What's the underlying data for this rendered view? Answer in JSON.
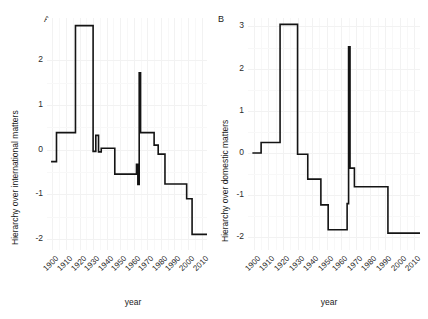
{
  "figure": {
    "width": 428,
    "height": 319,
    "background": "#ffffff",
    "gridline_color": "#f2f2f2",
    "line_color": "#141414"
  },
  "panels": {
    "a": {
      "tag": "A",
      "ylabel": "Hierarchy over international matters",
      "xlabel": "year"
    },
    "b": {
      "tag": "B",
      "ylabel": "Hierarchy over domestic matters",
      "xlabel": "year"
    }
  },
  "chart_data": [
    {
      "type": "line",
      "panel": "A",
      "title": "A",
      "xlabel": "year",
      "ylabel": "Hierarchy over international matters",
      "xlim": [
        1896,
        2014
      ],
      "ylim": [
        -2.25,
        2.95
      ],
      "xticks": [
        1900,
        1910,
        1920,
        1930,
        1940,
        1950,
        1960,
        1970,
        1980,
        1990,
        2000,
        2010
      ],
      "xticklabels": [
        "1900",
        "1910",
        "1920",
        "1930",
        "1940",
        "1950",
        "1960",
        "1970",
        "1980",
        "1990",
        "2000",
        "2010"
      ],
      "yticks": [
        -2,
        -1,
        0,
        1,
        2
      ],
      "yticklabels": [
        "-2",
        "-1",
        "0",
        "1",
        "2"
      ],
      "grid": true,
      "legend": "none",
      "step_style": "post",
      "x": [
        1899,
        1903,
        1913,
        1917,
        1928,
        1930,
        1932,
        1934,
        1936,
        1939,
        1946,
        1961,
        1962,
        1963,
        1964,
        1965,
        1966,
        1969,
        1975,
        1978,
        1983,
        1993,
        1999,
        2003,
        2013
      ],
      "y": [
        -0.27,
        0.38,
        0.38,
        2.78,
        2.78,
        -0.04,
        0.32,
        -0.05,
        0.03,
        0.03,
        -0.55,
        -0.55,
        -0.33,
        -0.78,
        1.72,
        0.38,
        0.38,
        0.38,
        0.1,
        -0.1,
        -0.77,
        -0.77,
        -1.1,
        -1.9,
        -1.9
      ]
    },
    {
      "type": "line",
      "panel": "B",
      "title": "B",
      "xlabel": "year",
      "ylabel": "Hierarchy over domestic matters",
      "xlim": [
        1896,
        2014
      ],
      "ylim": [
        -2.3,
        3.2
      ],
      "xticks": [
        1900,
        1910,
        1920,
        1930,
        1940,
        1950,
        1960,
        1970,
        1980,
        1990,
        2000,
        2010
      ],
      "xticklabels": [
        "1900",
        "1910",
        "1920",
        "1930",
        "1940",
        "1950",
        "1960",
        "1970",
        "1980",
        "1990",
        "2000",
        "2010"
      ],
      "yticks": [
        -2,
        -1,
        0,
        1,
        2,
        3
      ],
      "yticklabels": [
        "-2",
        "-1",
        "0",
        "1",
        "2",
        "3"
      ],
      "grid": true,
      "legend": "none",
      "step_style": "post",
      "x": [
        1899,
        1903,
        1905,
        1916,
        1918,
        1928,
        1930,
        1932,
        1937,
        1940,
        1946,
        1948,
        1951,
        1962,
        1964,
        1965,
        1966,
        1967,
        1969,
        1971,
        1978,
        1980,
        1990,
        1992,
        2013
      ],
      "y": [
        0.0,
        0.0,
        0.25,
        0.25,
        3.05,
        3.05,
        -0.03,
        -0.03,
        -0.62,
        -0.62,
        -1.23,
        -1.23,
        -1.82,
        -1.82,
        -1.2,
        2.52,
        -0.36,
        -0.36,
        -0.8,
        -0.8,
        -0.8,
        -0.8,
        -0.8,
        -1.9,
        -1.9
      ]
    }
  ]
}
